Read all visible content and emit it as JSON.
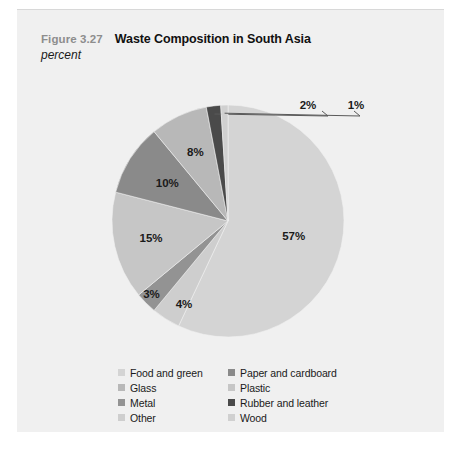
{
  "figure": {
    "number": "Figure 3.27",
    "title": "Waste Composition in South Asia",
    "subtitle": "percent"
  },
  "chart_data": {
    "type": "pie",
    "title": "Waste Composition in South Asia",
    "subtitle": "percent",
    "unit": "percent",
    "legend_position": "bottom",
    "start_angle_deg": 0,
    "direction": "clockwise",
    "categories": [
      "Food and green",
      "Paper and cardboard",
      "Glass",
      "Plastic",
      "Metal",
      "Rubber and leather",
      "Other",
      "Wood"
    ],
    "slices": [
      {
        "label": "Food and green",
        "value": 57,
        "display": "57%",
        "color": "#d4d4d4"
      },
      {
        "label": "Other",
        "value": 4,
        "display": "4%",
        "color": "#cecece"
      },
      {
        "label": "Metal",
        "value": 3,
        "display": "3%",
        "color": "#939393"
      },
      {
        "label": "Plastic",
        "value": 15,
        "display": "15%",
        "color": "#c6c6c6"
      },
      {
        "label": "Paper and cardboard",
        "value": 10,
        "display": "10%",
        "color": "#8a8a8a"
      },
      {
        "label": "Glass",
        "value": 8,
        "display": "8%",
        "color": "#b8b8b8"
      },
      {
        "label": "Rubber and leather",
        "value": 2,
        "display": "2%",
        "color": "#4a4a4a"
      },
      {
        "label": "Wood",
        "value": 1,
        "display": "1%",
        "color": "#d0d0d0"
      }
    ],
    "total": 100
  },
  "legend": {
    "items": [
      {
        "label": "Food and green",
        "color": "#d4d4d4"
      },
      {
        "label": "Paper and cardboard",
        "color": "#8a8a8a"
      },
      {
        "label": "Glass",
        "color": "#b8b8b8"
      },
      {
        "label": "Plastic",
        "color": "#c6c6c6"
      },
      {
        "label": "Metal",
        "color": "#939393"
      },
      {
        "label": "Rubber and leather",
        "color": "#4a4a4a"
      },
      {
        "label": "Other",
        "color": "#cecece"
      },
      {
        "label": "Wood",
        "color": "#d0d0d0"
      }
    ]
  },
  "colors": {
    "panel_background": "#f0f0f0",
    "page_background": "#ffffff",
    "figure_number": "#8d8d8d",
    "title": "#111111",
    "label": "#1a1a1a",
    "leader_line": "#5a5a5a"
  }
}
